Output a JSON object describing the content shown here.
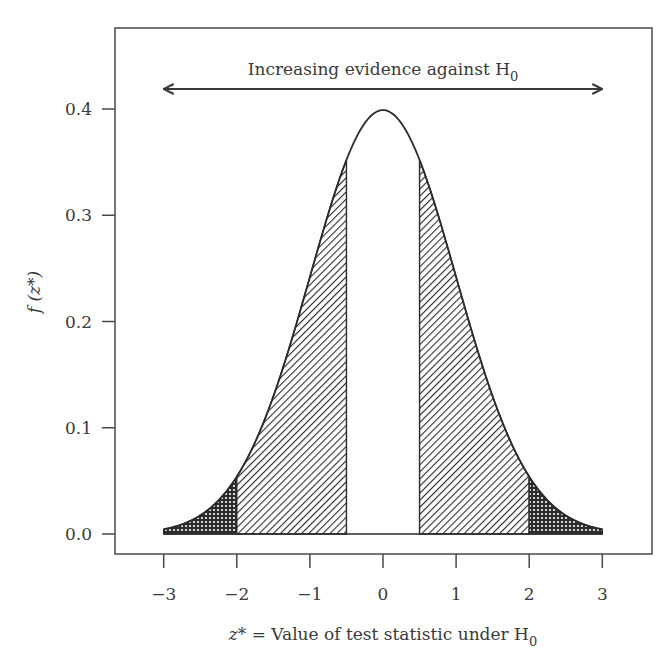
{
  "chart_data": {
    "type": "area",
    "title": "",
    "annotation": {
      "text": "Increasing evidence against H",
      "subscript": "0",
      "arrow": "double-headed",
      "x_range": [
        -3,
        3
      ]
    },
    "xlabel": {
      "italic_part": "z*",
      "text": " = Value of test statistic under H",
      "subscript": "0"
    },
    "ylabel": {
      "text": "f (z*)"
    },
    "xlim": [
      -3.67,
      3.68
    ],
    "ylim": [
      -0.019,
      0.476
    ],
    "x_ticks": [
      -3,
      -2,
      -1,
      0,
      1,
      2,
      3
    ],
    "x_tick_labels": [
      "−3",
      "−2",
      "−1",
      "0",
      "1",
      "2",
      "3"
    ],
    "y_ticks": [
      0.0,
      0.1,
      0.2,
      0.3,
      0.4
    ],
    "y_tick_labels": [
      "0.0",
      "0.1",
      "0.2",
      "0.3",
      "0.4"
    ],
    "grid": false,
    "legend": null,
    "curve": {
      "name": "Standard normal density",
      "function": "f(z) = exp(-z^2/2)/sqrt(2*pi)",
      "x_range": [
        -3,
        3
      ],
      "peak": {
        "x": 0,
        "y": 0.399
      }
    },
    "shaded_regions": [
      {
        "name": "left-outer-tail",
        "x_from": -3,
        "x_to": -2,
        "pattern": "cross-hatch"
      },
      {
        "name": "left-inner",
        "x_from": -2,
        "x_to": -0.5,
        "pattern": "diagonal-hatch"
      },
      {
        "name": "right-inner",
        "x_from": 0.5,
        "x_to": 2,
        "pattern": "diagonal-hatch"
      },
      {
        "name": "right-outer-tail",
        "x_from": 2,
        "x_to": 3,
        "pattern": "cross-hatch"
      }
    ],
    "unshaded_center": {
      "x_from": -0.5,
      "x_to": 0.5
    }
  },
  "style": {
    "line_color": "#2b2b2b",
    "axis_color": "#4a4a4a",
    "text_color": "#3a3a3a",
    "background": "#ffffff"
  }
}
